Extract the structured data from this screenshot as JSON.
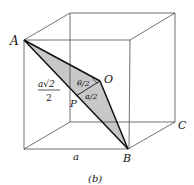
{
  "figure": {
    "caption": "(b)",
    "labels": {
      "A": "A",
      "B": "B",
      "C": "C",
      "O": "O",
      "P": "P",
      "edge": "a",
      "theta_half": "θ/2",
      "a_half": "a/2",
      "frac_num": "a√2",
      "frac_den": "2"
    },
    "colors": {
      "stroke": "#222222",
      "shade": "#c8c8c8",
      "background": "#ffffff"
    }
  }
}
